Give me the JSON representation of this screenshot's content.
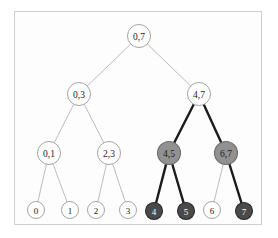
{
  "figure": {
    "width": 278,
    "height": 238,
    "background": "#ffffff",
    "frame": {
      "border_color": "#cfcfcf",
      "fill": "#fdfdfd",
      "x": 14,
      "y": 11,
      "width": 248,
      "height": 214
    }
  },
  "palette": {
    "node_fill_plain": "#ffffff",
    "node_fill_shaded": "#919191",
    "node_fill_dark": "#4a4a4a",
    "node_stroke_plain": "#9a9a9a",
    "node_stroke_shaded": "#6d6d6d",
    "node_stroke_dark": "#2b2b2b",
    "label_color_plain": "#1a1a1a",
    "label_color_inverse": "#ffffff",
    "edge_color_plain": "#b4b4b4",
    "edge_color_highlight": "#1c1c1c"
  },
  "nodes": [
    {
      "id": "n0_7",
      "label": "0,7",
      "x": 139,
      "y": 36,
      "r": 11.5,
      "style": "plain",
      "level": 0
    },
    {
      "id": "n0_3",
      "label": "0,3",
      "x": 79,
      "y": 94,
      "r": 11.5,
      "style": "plain",
      "level": 1
    },
    {
      "id": "n4_7",
      "label": "4,7",
      "x": 199,
      "y": 94,
      "r": 11.5,
      "style": "plain",
      "level": 1
    },
    {
      "id": "n0_1",
      "label": "0,1",
      "x": 49,
      "y": 153,
      "r": 11.5,
      "style": "plain",
      "level": 2
    },
    {
      "id": "n2_3",
      "label": "2,3",
      "x": 109,
      "y": 153,
      "r": 11.5,
      "style": "plain",
      "level": 2
    },
    {
      "id": "n4_5",
      "label": "4,5",
      "x": 169,
      "y": 153,
      "r": 11.5,
      "style": "shaded",
      "level": 2
    },
    {
      "id": "n6_7",
      "label": "6,7",
      "x": 226,
      "y": 153,
      "r": 11.5,
      "style": "shaded",
      "level": 2
    },
    {
      "id": "l0",
      "label": "0",
      "x": 36,
      "y": 210,
      "r": 8.5,
      "style": "plain",
      "level": 3
    },
    {
      "id": "l1",
      "label": "1",
      "x": 70,
      "y": 210,
      "r": 8.5,
      "style": "plain",
      "level": 3
    },
    {
      "id": "l2",
      "label": "2",
      "x": 96,
      "y": 210,
      "r": 8.5,
      "style": "plain",
      "level": 3
    },
    {
      "id": "l3",
      "label": "3",
      "x": 128,
      "y": 210,
      "r": 8.5,
      "style": "plain",
      "level": 3
    },
    {
      "id": "l4",
      "label": "4",
      "x": 154,
      "y": 211,
      "r": 8.5,
      "style": "dark",
      "level": 3
    },
    {
      "id": "l5",
      "label": "5",
      "x": 186,
      "y": 211,
      "r": 8.5,
      "style": "dark",
      "level": 3
    },
    {
      "id": "l6",
      "label": "6",
      "x": 212,
      "y": 210,
      "r": 8.5,
      "style": "plain",
      "level": 3
    },
    {
      "id": "l7",
      "label": "7",
      "x": 244,
      "y": 211,
      "r": 8.5,
      "style": "dark",
      "level": 3
    }
  ],
  "edges": [
    {
      "from": "n0_7",
      "to": "n0_3",
      "style": "plain"
    },
    {
      "from": "n0_7",
      "to": "n4_7",
      "style": "plain"
    },
    {
      "from": "n0_3",
      "to": "n0_1",
      "style": "plain"
    },
    {
      "from": "n0_3",
      "to": "n2_3",
      "style": "plain"
    },
    {
      "from": "n4_7",
      "to": "n4_5",
      "style": "highlight"
    },
    {
      "from": "n4_7",
      "to": "n6_7",
      "style": "highlight"
    },
    {
      "from": "n0_1",
      "to": "l0",
      "style": "plain"
    },
    {
      "from": "n0_1",
      "to": "l1",
      "style": "plain"
    },
    {
      "from": "n2_3",
      "to": "l2",
      "style": "plain"
    },
    {
      "from": "n2_3",
      "to": "l3",
      "style": "plain"
    },
    {
      "from": "n4_5",
      "to": "l4",
      "style": "highlight"
    },
    {
      "from": "n4_5",
      "to": "l5",
      "style": "highlight"
    },
    {
      "from": "n6_7",
      "to": "l6",
      "style": "plain"
    },
    {
      "from": "n6_7",
      "to": "l7",
      "style": "highlight"
    }
  ]
}
